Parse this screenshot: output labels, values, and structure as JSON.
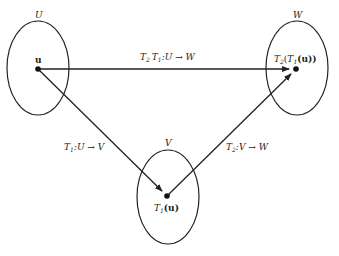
{
  "diagram": {
    "sets": [
      {
        "id": "U",
        "label": "U",
        "cx": 38,
        "cy": 68,
        "rx": 31,
        "ry": 47
      },
      {
        "id": "W",
        "label": "W",
        "cx": 297,
        "cy": 68,
        "rx": 31,
        "ry": 47
      },
      {
        "id": "V",
        "label": "V",
        "cx": 168,
        "cy": 197,
        "rx": 31,
        "ry": 47
      }
    ],
    "points": [
      {
        "id": "u",
        "label": "u",
        "x": 38,
        "y": 69
      },
      {
        "id": "T1u",
        "label": "T1(u)",
        "x": 167,
        "y": 196
      },
      {
        "id": "T2T1u",
        "label": "T2(T1(u))",
        "x": 296,
        "y": 69
      }
    ],
    "arrows": [
      {
        "from": "u",
        "to": "T2T1u",
        "label": "T2 T1: U → W"
      },
      {
        "from": "u",
        "to": "T1u",
        "label": "T1: U → V"
      },
      {
        "from": "T1u",
        "to": "T2T1u",
        "label": "T2: V → W"
      }
    ],
    "labels": {
      "set_U": "U",
      "set_V": "V",
      "set_W": "W",
      "point_u": "u",
      "point_T1u_T": "T",
      "point_T1u_sub": "1",
      "point_T1u_arg": "(u)",
      "point_T2T1u_T": "T",
      "point_T2T1u_sub": "2",
      "point_T2T1u_open": "(",
      "point_T2T1u_inner_T": "T",
      "point_T2T1u_inner_sub": "1",
      "point_T2T1u_arg": "(u))",
      "arrow_top_T2": "T",
      "arrow_top_sub2": "2",
      "arrow_top_T1": "T",
      "arrow_top_sub1": "1",
      "arrow_top_map": ":U → W",
      "arrow_left_T": "T",
      "arrow_left_sub": "1",
      "arrow_left_map": ":U → V",
      "arrow_right_T": "T",
      "arrow_right_sub": "2",
      "arrow_right_map": ":V → W"
    }
  }
}
